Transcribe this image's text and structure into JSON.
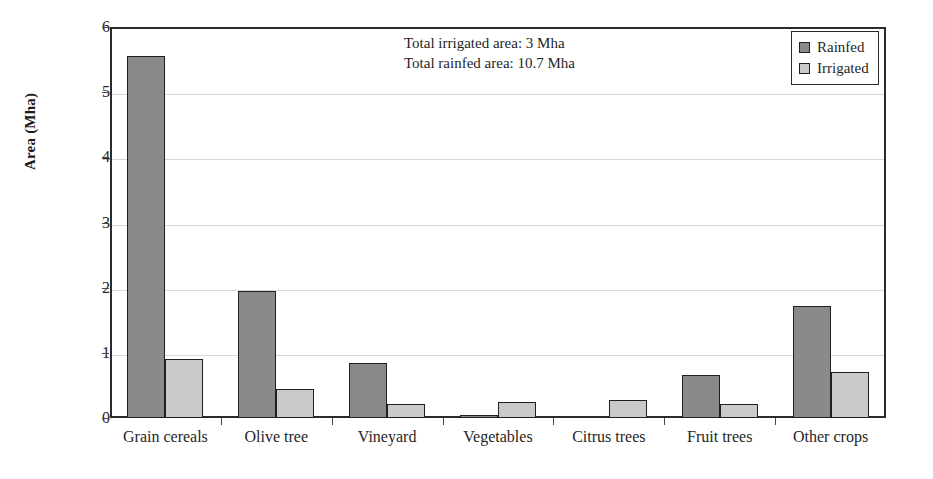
{
  "chart_data": {
    "type": "bar",
    "title": "",
    "subtitle": "",
    "xlabel": "",
    "ylabel": "Area (Mha)",
    "ylim": [
      0,
      6
    ],
    "ytick_labels": [
      "0",
      "1",
      "2",
      "3",
      "4",
      "5",
      "6"
    ],
    "ytick_values": [
      0,
      1,
      2,
      3,
      4,
      5,
      6
    ],
    "grid": true,
    "grid_axis": "y",
    "legend_position": "top-right",
    "categories": [
      "Grain cereals",
      "Olive tree",
      "Vineyard",
      "Vegetables",
      "Citrus trees",
      "Fruit trees",
      "Other crops"
    ],
    "series": [
      {
        "name": "Rainfed",
        "color": "#8a8a8a",
        "values": [
          5.55,
          1.95,
          0.84,
          0.03,
          0.0,
          0.66,
          1.72
        ]
      },
      {
        "name": "Irrigated",
        "color": "#cacaca",
        "values": [
          0.91,
          0.44,
          0.22,
          0.25,
          0.27,
          0.22,
          0.71
        ]
      }
    ],
    "annotations": [
      "Total irrigated area: 3 Mha",
      "Total rainfed area: 10.7 Mha"
    ]
  },
  "legend": {
    "items": [
      {
        "label": "Rainfed"
      },
      {
        "label": "Irrigated"
      }
    ]
  },
  "colors": {
    "rainfed": "#8a8a8a",
    "irrigated": "#cacaca",
    "axis": "#2b2b2b",
    "grid": "#d8d8d8",
    "text": "#1a1a1a",
    "background": "#ffffff"
  }
}
